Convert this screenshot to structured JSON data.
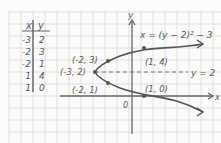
{
  "table": {
    "headers": [
      "x",
      "y"
    ],
    "rows": [
      [
        "-3",
        "2"
      ],
      [
        "-2",
        "3"
      ],
      [
        "-2",
        "1"
      ],
      [
        "1",
        "4"
      ],
      [
        "1",
        "0"
      ]
    ]
  },
  "graph": {
    "equation": "x = (y − 2)² − 3",
    "axis_of_symmetry_label": "y = 2",
    "x_axis_label": "x",
    "y_axis_label": "y",
    "origin_label": "0",
    "points": [
      {
        "label": "(-3, 2)",
        "x": -3,
        "y": 2,
        "note": "vertex"
      },
      {
        "label": "(-2, 3)",
        "x": -2,
        "y": 3
      },
      {
        "label": "(-2, 1)",
        "x": -2,
        "y": 1
      },
      {
        "label": "(1, 4)",
        "x": 1,
        "y": 4
      },
      {
        "label": "(1, 0)",
        "x": 1,
        "y": 0
      }
    ]
  },
  "colors": {
    "background": "#fbfbfa",
    "grid": "#d9d9d9",
    "ink": "#5a5a5a"
  }
}
